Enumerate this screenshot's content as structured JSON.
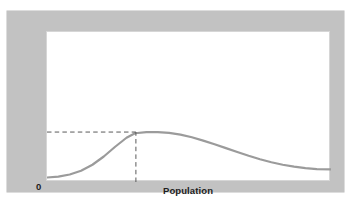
{
  "figure": {
    "panel_color": "#c2c2c2",
    "plot_background": "#ffffff",
    "plot_border_color": "#d6d6d6"
  },
  "labels": {
    "ylabel": "Average standard of living",
    "xlabel": "Population",
    "origin": "0"
  },
  "chart_data": {
    "type": "line",
    "title": "",
    "xlabel": "Population",
    "ylabel": "Average standard of living",
    "xlim": [
      0,
      100
    ],
    "ylim": [
      0,
      100
    ],
    "grid": false,
    "legend": null,
    "axis_tick_labels": {
      "x": [],
      "y": [],
      "origin": "0"
    },
    "line_color": "#9b9b9b",
    "line_width": 2.2,
    "series": [
      {
        "name": "Average standard of living",
        "x": [
          0,
          4,
          8,
          12,
          16,
          20,
          24,
          28,
          31,
          35,
          39,
          43,
          47,
          51,
          55,
          59,
          63,
          67,
          71,
          75,
          79,
          83,
          87,
          91,
          95,
          100
        ],
        "y": [
          3,
          3.6,
          5,
          7.5,
          11.5,
          17,
          23.5,
          29.5,
          32.5,
          33.2,
          33.3,
          32.8,
          31.6,
          29.8,
          27.6,
          25.2,
          22.6,
          20.0,
          17.5,
          15.2,
          13.2,
          11.5,
          10.2,
          9.2,
          8.6,
          8.4
        ]
      }
    ],
    "annotations": [
      {
        "type": "dashed-guide-horizontal",
        "label": "maximum average standard of living",
        "y": 33.3,
        "x_from": 0,
        "x_to": 31.3,
        "color": "#5a5a5a"
      },
      {
        "type": "dashed-guide-vertical",
        "label": "optimum population",
        "x": 31.3,
        "y_from": 0,
        "y_to": 33.3,
        "color": "#5a5a5a"
      }
    ],
    "peak": {
      "x": 31.3,
      "y": 33.3,
      "description": "peak of the average standard of living curve"
    }
  }
}
